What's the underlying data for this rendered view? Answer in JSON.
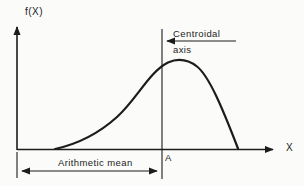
{
  "figure": {
    "background_color": "#fbfbf9",
    "ink_color": "#1c1c1c",
    "y_axis_label": "f(X)",
    "x_axis_label": "X",
    "point_label": "A",
    "centroidal_label_line1": "Centroidal",
    "centroidal_label_line2": "axis",
    "arithmetic_mean_label": "Arithmetic mean"
  }
}
